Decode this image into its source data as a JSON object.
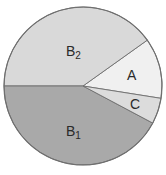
{
  "chart_data": {
    "type": "pie",
    "title": "",
    "slices": [
      {
        "label": "A",
        "sub": "",
        "value": 12,
        "start_deg": -9,
        "end_deg": 35.5,
        "color": "#f0f0f0"
      },
      {
        "label": "B",
        "sub": "2",
        "value": 40,
        "start_deg": 35.5,
        "end_deg": 180,
        "color": "#d9d9d9"
      },
      {
        "label": "B",
        "sub": "1",
        "value": 42,
        "start_deg": 180,
        "end_deg": 332,
        "color": "#a9a9a9"
      },
      {
        "label": "C",
        "sub": "",
        "value": 5,
        "start_deg": 332,
        "end_deg": 351,
        "color": "#dcdcdc"
      }
    ],
    "categories": [
      "A",
      "B2",
      "B1",
      "C"
    ],
    "values": [
      12,
      40,
      42,
      5
    ],
    "legend": "none",
    "grid": false
  },
  "geometry": {
    "cx": 83,
    "cy": 86,
    "r": 79
  },
  "labels": {
    "A": {
      "text": "A",
      "sub": "",
      "x": 127,
      "y": 80
    },
    "B2": {
      "text": "B",
      "sub": "2",
      "x": 66,
      "y": 56
    },
    "B1": {
      "text": "B",
      "sub": "1",
      "x": 66,
      "y": 136
    },
    "C": {
      "text": "C",
      "sub": "",
      "x": 130,
      "y": 109
    }
  }
}
